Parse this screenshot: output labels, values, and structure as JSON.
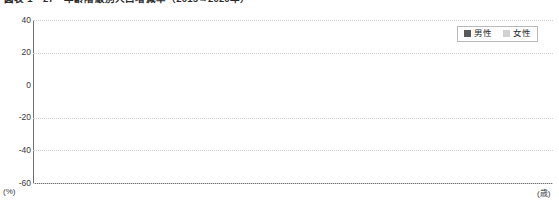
{
  "figure": {
    "title": "図表 1－27　年齢階級別人口増減率（2015→2020年）",
    "unit_y": "(%)",
    "unit_x": "(歳)"
  },
  "legend": {
    "position": "top-right",
    "items": [
      {
        "label": "男性",
        "color": "#595959",
        "key": "male"
      },
      {
        "label": "女性",
        "color": "#d2d2d2",
        "key": "female"
      }
    ]
  },
  "chart_data": {
    "type": "bar",
    "title": "図表 1－27　年齢階級別人口増減率（2015→2020年）",
    "xlabel": "(歳)",
    "ylabel": "(%)",
    "ylim": [
      -60,
      40
    ],
    "yticks": [
      40,
      20,
      0,
      -20,
      -40,
      -60
    ],
    "grid": true,
    "legend_position": "top-right",
    "categories": [
      "～4",
      "～9",
      "～14",
      "～19",
      "～24",
      "～29",
      "～34",
      "～39",
      "～44",
      "～49",
      "～54",
      "～59",
      "～64",
      "～69",
      "～74",
      "～79",
      "～84",
      "～89",
      "90～"
    ],
    "series": [
      {
        "name": "男性",
        "color": "#595959",
        "values": [
          -11,
          9,
          3,
          0.5,
          -30,
          33,
          18,
          28,
          5,
          6,
          16,
          -1,
          -4,
          -3,
          -1,
          -9,
          -13,
          -21,
          -57
        ]
      },
      {
        "name": "女性",
        "color": "#d2d2d2",
        "values": [
          4,
          -9,
          -3,
          -0.5,
          -29,
          -2,
          17,
          8,
          13,
          1,
          -1,
          -3,
          -2,
          -4,
          -7,
          -11,
          -15,
          -16,
          -45
        ]
      }
    ]
  }
}
